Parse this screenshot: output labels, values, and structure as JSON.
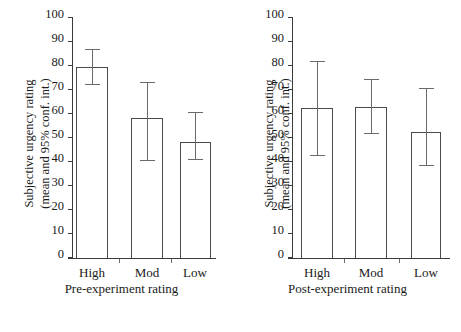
{
  "chart_data": {
    "type": "bar",
    "title": "",
    "ylabel_line1": "Subjective urgency rating",
    "ylabel_line2": "(mean and 95% conf. int.)",
    "ylim": [
      0,
      100
    ],
    "yticks": [
      0,
      10,
      20,
      30,
      40,
      50,
      60,
      70,
      80,
      90,
      100
    ],
    "ytick_labels": [
      "0",
      "10",
      "20",
      "30",
      "40",
      "50",
      "60",
      "70",
      "80",
      "90",
      "100"
    ],
    "grid": false,
    "legend": "none",
    "error_type": "95% confidence interval",
    "panels": [
      {
        "name": "pre-experiment",
        "xlabel": "Pre-experiment rating",
        "categories": [
          "High",
          "Mod",
          "Low"
        ],
        "values": [
          79.5,
          58.5,
          48.5
        ],
        "ci_lower": [
          72.0,
          40.5,
          41.0
        ],
        "ci_upper": [
          87.0,
          73.5,
          61.0
        ]
      },
      {
        "name": "post-experiment",
        "xlabel": "Post-experiment rating",
        "categories": [
          "High",
          "Mod",
          "Low"
        ],
        "values": [
          62.5,
          63.0,
          52.5
        ],
        "ci_lower": [
          42.5,
          51.5,
          38.5
        ],
        "ci_upper": [
          82.0,
          74.5,
          71.0
        ]
      }
    ]
  }
}
